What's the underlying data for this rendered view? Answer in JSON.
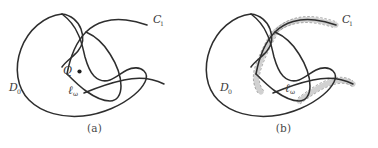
{
  "figure": {
    "width": 378,
    "height": 148,
    "background": "#ffffff",
    "stroke_color": "#2e2e2e",
    "tube_color": "#c9c9c9",
    "dash_color": "#5a5a5a",
    "label_color": "#3a3a3a"
  },
  "panels": [
    {
      "id": "a",
      "caption": "(a)",
      "labels": {
        "domain": "D",
        "domain_sub": "0",
        "curve_c": "C",
        "curve_c_sub": "1",
        "point": "Q",
        "curve_ell": "ℓ",
        "curve_ell_sub": "ω"
      },
      "has_tube": false,
      "has_point_marker": true
    },
    {
      "id": "b",
      "caption": "(b)",
      "labels": {
        "domain": "D",
        "domain_sub": "0",
        "curve_c": "C",
        "curve_c_sub": "1",
        "curve_ell": "ℓ",
        "curve_ell_sub": "ω"
      },
      "has_tube": true,
      "has_point_marker": false
    }
  ]
}
